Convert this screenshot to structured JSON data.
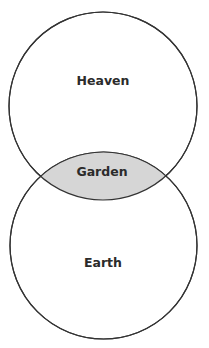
{
  "diagram": {
    "type": "venn",
    "colors": {
      "stroke": "#333333",
      "intersection_fill": "#d6d6d6",
      "circle_fill": "#ffffff",
      "text": "#2b2b2b"
    },
    "sets": [
      {
        "id": "top",
        "label": "Heaven"
      },
      {
        "id": "bottom",
        "label": "Earth"
      }
    ],
    "intersection": {
      "label": "Garden"
    }
  }
}
